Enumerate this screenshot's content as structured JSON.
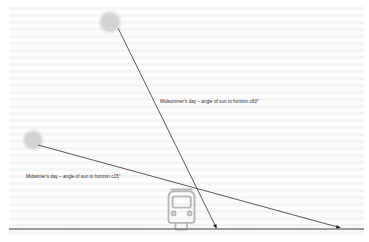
{
  "diagram": {
    "ground_label": "horizon line",
    "labels": {
      "midsummer": "Midsummer's day – angle of sun to horizon c60°",
      "midwinter": "Midwinter's day – angle of sun to horizon c15°"
    },
    "icons": {
      "sun_midsummer": "sun-icon",
      "sun_midwinter": "sun-icon",
      "vehicle": "tram-front-icon"
    },
    "colors": {
      "ray_line": "#3a3a3a",
      "ground_line": "#7a7a7a",
      "sun_fill": "#d5d5d5",
      "vehicle_outline": "#b4b4b4",
      "background": "#fbfbfb",
      "text": "#2b2b2b"
    },
    "geometry": {
      "ground_y": 229,
      "midsummer_ray": {
        "from": [
          118,
          28
        ],
        "to": [
          217,
          228
        ],
        "angle_deg": 60
      },
      "midwinter_ray": {
        "from": [
          38,
          145
        ],
        "to": [
          340,
          228
        ],
        "angle_deg": 15
      },
      "sun_midsummer_center": [
        110,
        22
      ],
      "sun_midwinter_center": [
        33,
        140
      ],
      "vehicle_center": [
        181,
        207
      ]
    }
  }
}
